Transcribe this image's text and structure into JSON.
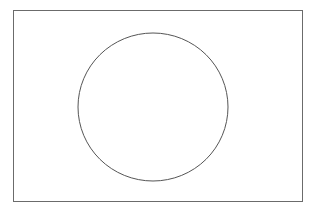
{
  "diagram": {
    "background": "#ffffff",
    "frame": {
      "x": 13.5,
      "y": 10.5,
      "width": 289,
      "height": 191,
      "stroke": "#6b6b6b",
      "stroke_width": 1
    },
    "circle": {
      "cx": 153,
      "cy": 107,
      "rx": 75,
      "ry": 74,
      "stroke": "#555555",
      "stroke_width": 1,
      "fill": "none"
    }
  }
}
